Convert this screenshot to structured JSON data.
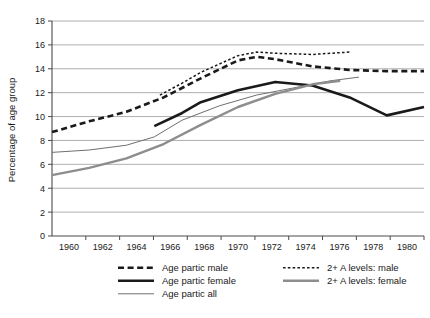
{
  "chart_data": {
    "type": "line",
    "title": "",
    "xlabel": "",
    "ylabel": "Percentage of age group",
    "ylim": [
      0,
      18
    ],
    "ytick_step": 2,
    "yticks": [
      "0",
      "2",
      "4",
      "6",
      "8",
      "10",
      "12",
      "14",
      "16",
      "18"
    ],
    "xticks": [
      "1960",
      "1962",
      "1964",
      "1966",
      "1968",
      "1970",
      "1972",
      "1974",
      "1976",
      "1978",
      "1980"
    ],
    "xlim": [
      1960,
      1980
    ],
    "grid": "horizontal",
    "legend_position": "bottom",
    "series": [
      {
        "name": "Age partic male",
        "style": "thick-dashed",
        "color": "#1a1a1a",
        "x": [
          1960,
          1962,
          1964,
          1966,
          1968,
          1970,
          1971,
          1972,
          1974,
          1976,
          1978,
          1980
        ],
        "values": [
          8.7,
          9.6,
          10.4,
          11.6,
          13.2,
          14.7,
          15.0,
          14.8,
          14.2,
          13.9,
          13.8,
          13.8
        ]
      },
      {
        "name": "Age partic female",
        "style": "thick-solid",
        "color": "#1a1a1a",
        "x": [
          1965.5,
          1967,
          1968,
          1970,
          1972,
          1974,
          1976,
          1978,
          1980
        ],
        "values": [
          9.2,
          10.3,
          11.2,
          12.2,
          12.9,
          12.6,
          11.6,
          10.1,
          10.8
        ]
      },
      {
        "name": "Age partic all",
        "style": "thin-solid-dark",
        "color": "#6f6f6f",
        "x": [
          1960,
          1962,
          1964,
          1965.5,
          1967,
          1969,
          1971,
          1973,
          1975,
          1976.5
        ],
        "values": [
          7.0,
          7.2,
          7.6,
          8.3,
          9.7,
          10.9,
          11.8,
          12.4,
          13.0,
          13.3
        ]
      },
      {
        "name": "2+ A levels: male",
        "style": "fine-dotted",
        "color": "#1a1a1a",
        "x": [
          1965.8,
          1967,
          1968,
          1970,
          1971,
          1972,
          1974,
          1976
        ],
        "values": [
          11.8,
          12.8,
          13.7,
          15.1,
          15.4,
          15.3,
          15.2,
          15.4
        ]
      },
      {
        "name": "2+ A levels: female",
        "style": "thick-gray",
        "color": "#8d8d8d",
        "x": [
          1960,
          1962,
          1964,
          1966,
          1968,
          1970,
          1972,
          1974,
          1975.5
        ],
        "values": [
          5.1,
          5.7,
          6.5,
          7.7,
          9.3,
          10.8,
          11.9,
          12.7,
          13.0
        ]
      }
    ],
    "legend": [
      {
        "label": "Age partic male",
        "swatch": "thick-dashed"
      },
      {
        "label": "2+ A levels: male",
        "swatch": "fine-dotted"
      },
      {
        "label": "Age partic female",
        "swatch": "thick-solid"
      },
      {
        "label": "2+ A levels: female",
        "swatch": "thick-gray"
      },
      {
        "label": "Age partic all",
        "swatch": "thin-solid-dark"
      }
    ]
  }
}
